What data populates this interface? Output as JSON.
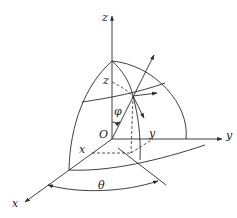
{
  "diagram": {
    "colors": {
      "stroke": "#2a2a2a",
      "background": "#ffffff"
    },
    "labels": {
      "z_axis": "z",
      "y_axis": "y",
      "x_axis": "x",
      "origin": "O",
      "z_coord": "z",
      "y_coord": "y",
      "x_coord": "x",
      "phi": "φ",
      "theta": "θ"
    },
    "elements": [
      "z-axis",
      "y-axis",
      "x-axis",
      "octant-sphere-surface",
      "latitude-circle",
      "meridian-through-point",
      "radial-vector",
      "unit-vectors-at-point",
      "projection-lines",
      "phi-angle-arc",
      "theta-angle-arc"
    ]
  }
}
